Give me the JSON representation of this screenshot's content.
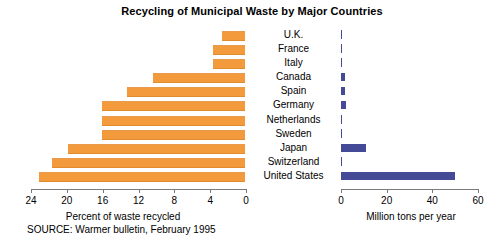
{
  "chart_data": {
    "type": "bar",
    "title": "Recycling of Municipal Waste by Major Countries",
    "orientation": "horizontal",
    "categories": [
      "U.K.",
      "France",
      "Italy",
      "Canada",
      "Spain",
      "Germany",
      "Netherlands",
      "Sweden",
      "Japan",
      "Switzerland",
      "United States"
    ],
    "panels": [
      {
        "name": "percent-recycled",
        "xlabel": "Percent of waste recycled",
        "direction": "right-to-left",
        "xlim": [
          0,
          24
        ],
        "ticks": [
          24,
          20,
          16,
          12,
          8,
          4,
          0
        ],
        "color": "#F29A3C",
        "values": [
          2.6,
          3.6,
          3.6,
          10.3,
          13.2,
          16,
          16,
          16,
          19.8,
          21.5,
          23
        ]
      },
      {
        "name": "million-tons-per-year",
        "xlabel": "Million tons per year",
        "direction": "left-to-right",
        "xlim": [
          0,
          60
        ],
        "ticks": [
          0,
          20,
          40,
          60
        ],
        "color": "#454A96",
        "values": [
          0.3,
          0.3,
          0.3,
          1.6,
          1.6,
          2.4,
          0.6,
          0.3,
          11,
          0.4,
          50
        ]
      }
    ],
    "grid": false,
    "legend": "none",
    "source": "SOURCE: Warmer bulletin, February 1995"
  },
  "source_note": "SOURCE: Warmer bulletin, February 1995"
}
